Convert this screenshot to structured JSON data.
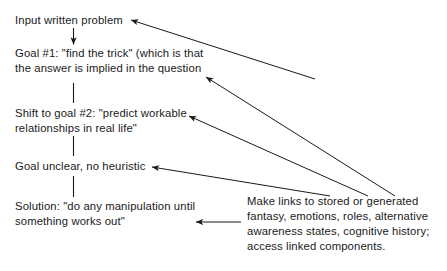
{
  "diagram": {
    "ink_color": "#1a1a1a",
    "background_color": "#ffffff",
    "flow_nodes": [
      {
        "id": "input",
        "text": "Input written problem"
      },
      {
        "id": "goal1",
        "text": "Goal #1: \"find the trick\" (which is that\nthe answer is implied in the question"
      },
      {
        "id": "shift",
        "text": "Shift to goal #2: \"predict workable\nrelationships in real life\""
      },
      {
        "id": "goal_unclear",
        "text": "Goal unclear, no heuristic"
      },
      {
        "id": "solution",
        "text": "Solution: \"do any manipulation until\nsomething works out\""
      }
    ],
    "side_note": {
      "id": "links",
      "text": "Make links to stored or generated\nfantasy, emotions, roles, alternative\nawareness states, cognitive history;\naccess linked components."
    },
    "connectors": {
      "vertical_count": 4,
      "incoming_arrow_count": 5
    }
  }
}
